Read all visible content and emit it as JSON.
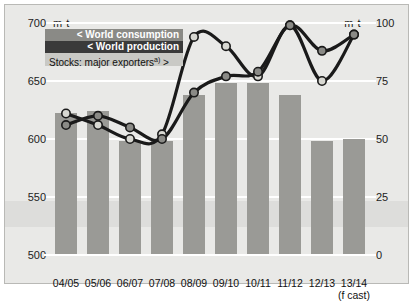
{
  "units": {
    "left": "m t",
    "right": "m t"
  },
  "legend": {
    "consumption": "< World consumption",
    "production": "< World production",
    "stocks": "Stocks: major exporters",
    "stocks_footnote": "a)",
    "stocks_arrow": ">"
  },
  "chart_data": {
    "type": "bar",
    "title": "",
    "xlabel": "",
    "ylabel": "m t",
    "categories": [
      "04/05",
      "05/06",
      "06/07",
      "07/08",
      "08/09",
      "09/10",
      "10/11",
      "11/12",
      "12/13",
      "13/14"
    ],
    "category_sublabels": [
      "",
      "",
      "",
      "",
      "",
      "",
      "",
      "",
      "",
      "(f cast)"
    ],
    "left_axis": {
      "label": "m t",
      "ticks": [
        500,
        550,
        600,
        650,
        700
      ],
      "ylim": [
        500,
        700
      ]
    },
    "right_axis": {
      "label": "m t",
      "ticks": [
        0,
        25,
        50,
        75,
        100
      ],
      "ylim": [
        0,
        100
      ]
    },
    "grid": true,
    "legend_position": "top-left",
    "series": [
      {
        "name": "Stocks: major exporters a)",
        "type": "bar",
        "axis": "right",
        "values": [
          61,
          62,
          49,
          49,
          69,
          74,
          74,
          69,
          49,
          50
        ],
        "color": "#9a9a96"
      },
      {
        "name": "World consumption",
        "type": "line",
        "axis": "right",
        "marker": "light-circle",
        "values": [
          61,
          56,
          50,
          52,
          94,
          90,
          77,
          99,
          75,
          95
        ],
        "color": "#1a1a1a",
        "marker_color": "#d8d8d2"
      },
      {
        "name": "World production",
        "type": "line",
        "axis": "right",
        "marker": "dark-circle",
        "values": [
          56,
          60,
          55,
          50,
          70,
          77,
          79,
          99,
          88,
          95
        ],
        "color": "#1a1a1a",
        "marker_color": "#8a8a86"
      }
    ]
  }
}
